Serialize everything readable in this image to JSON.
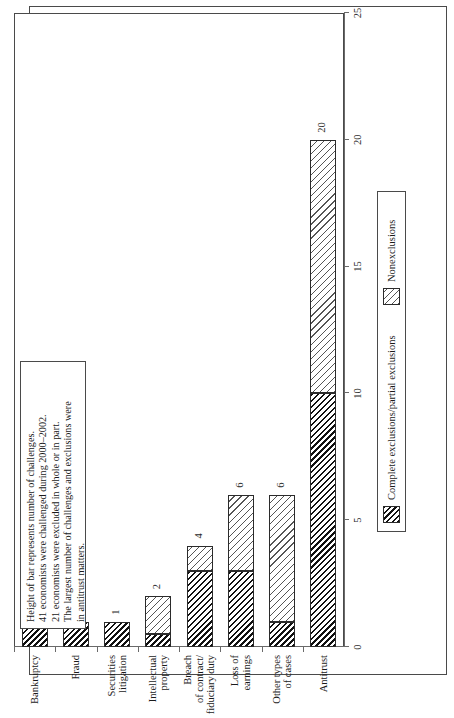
{
  "figure": {
    "note_lines": [
      "Height of bar represents number of challenges.",
      "41 economists were challenged during 2000–2002.",
      "21 economists were excluded in whole or in part.",
      "The largest number of challenges and exclusions were",
      "in antitrust matters."
    ]
  },
  "legend": {
    "items": [
      {
        "label": "Complete exclusions/partial exclusions",
        "pattern": "dark-hatch",
        "color": "#111111"
      },
      {
        "label": "Nonexclusions",
        "pattern": "light-hatch",
        "color": "#555555"
      }
    ]
  },
  "chart_data": {
    "type": "bar",
    "title": "",
    "xlabel": "",
    "ylabel": "",
    "orientation": "vertical-rotated",
    "grid": false,
    "legend_position": "bottom",
    "ylim": [
      0,
      25
    ],
    "yticks": [
      0,
      5,
      10,
      15,
      20,
      25
    ],
    "categories": [
      "Bankruptcy",
      "Fraud",
      "Securities litigation",
      "Intellectual property",
      "Breach of contract/ fiduciary duty",
      "Loss of earnings",
      "Other types of cases",
      "Antitrust"
    ],
    "category_lines": [
      [
        "Bankruptcy"
      ],
      [
        "Fraud"
      ],
      [
        "Securities",
        "litigation"
      ],
      [
        "Intellectual",
        "property"
      ],
      [
        "Breach",
        "of contract/",
        "fiduciary duty"
      ],
      [
        "Loss of",
        "earnings"
      ],
      [
        "Other types",
        "of cases"
      ],
      [
        "Antitrust"
      ]
    ],
    "totals": [
      1,
      1,
      1,
      2,
      4,
      6,
      6,
      20
    ],
    "series": [
      {
        "name": "Complete exclusions/partial exclusions",
        "values": [
          1,
          1,
          1,
          0.5,
          3,
          3,
          1,
          10
        ]
      },
      {
        "name": "Nonexclusions",
        "values": [
          0,
          0,
          0,
          1.5,
          1,
          3,
          5,
          10
        ]
      }
    ]
  }
}
